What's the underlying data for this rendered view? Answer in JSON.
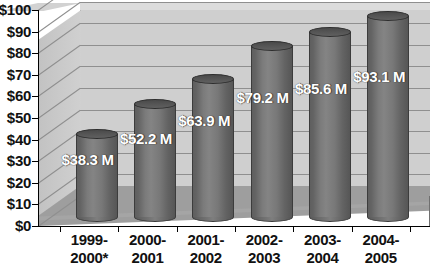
{
  "chart_data": {
    "type": "bar",
    "title": "",
    "subtitle": "",
    "xlabel": "",
    "ylabel": "",
    "categories": [
      "1999-2000*",
      "2000-2001",
      "2001-2002",
      "2002-2003",
      "2003-2004",
      "2004-2005"
    ],
    "category_lines": [
      [
        "1999-",
        "2000*"
      ],
      [
        "2000-",
        "2001"
      ],
      [
        "2001-",
        "2002"
      ],
      [
        "2002-",
        "2003"
      ],
      [
        "2003-",
        "2004"
      ],
      [
        "2004-",
        "2005"
      ]
    ],
    "values": [
      38.3,
      52.2,
      63.9,
      79.2,
      85.6,
      93.1
    ],
    "data_labels": [
      "$38.3 M",
      "$52.2 M",
      "$63.9 M",
      "$79.2 M",
      "$85.6 M",
      "$93.1 M"
    ],
    "ylim": [
      0,
      100
    ],
    "ytick_values": [
      0,
      10,
      20,
      30,
      40,
      50,
      60,
      70,
      80,
      90,
      100
    ],
    "ytick_labels": [
      "$0",
      "$10",
      "$20",
      "$30",
      "$40",
      "$50",
      "$60",
      "$70",
      "$80",
      "$90",
      "$100"
    ],
    "grid": true,
    "grid_orientation": "horizontal",
    "legend": false,
    "legend_position": "none",
    "style": "3d-cylinder",
    "units": "millions of dollars",
    "annotations": [
      "* asterisk on first category label"
    ],
    "colors": {
      "bar_fill": "#7b7b7b",
      "bar_edge": "#3c3c3c",
      "bar_top": "#4a4a4a",
      "back_wall": "#cfcfcf",
      "side_wall": "#c8c8c8",
      "floor": "#9e9e9e",
      "gridline": "#8f8f8f",
      "axis": "#000000",
      "label_text": "#111111",
      "data_label_text": "#ffffff",
      "background": "#ffffff"
    }
  }
}
